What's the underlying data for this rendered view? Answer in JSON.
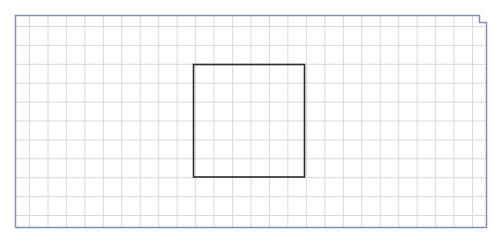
{
  "canvas": {
    "width": 502,
    "height": 241,
    "background": "#ffffff"
  },
  "grid": {
    "color": "#d6d8de",
    "x_start": 29.5,
    "x_step": 18.46,
    "x_count": 25,
    "y_start": 26.5,
    "y_step": 18.9,
    "y_count": 11,
    "area": {
      "left": 15.5,
      "top": 15.5,
      "right": 486.5,
      "bottom": 227.5
    }
  },
  "border": {
    "color": "#7e90b8",
    "points": [
      [
        15.5,
        15.5
      ],
      [
        479.5,
        15.5
      ],
      [
        479.5,
        22.5
      ],
      [
        486.5,
        22.5
      ],
      [
        486.5,
        227.5
      ],
      [
        15.5,
        227.5
      ]
    ]
  },
  "square": {
    "color": "#2b2b2b",
    "x": 193.5,
    "y": 64.5,
    "width": 111,
    "height": 112.5
  }
}
